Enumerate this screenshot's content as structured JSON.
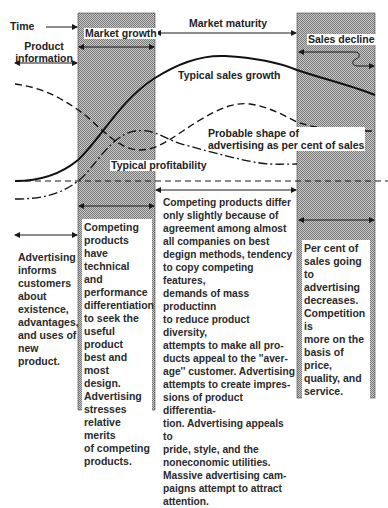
{
  "labels": {
    "time": "Time",
    "product_information": [
      "Product",
      "information"
    ],
    "market_growth": "Market growth",
    "market_maturity": "Market maturity",
    "sales_decline": "Sales decline",
    "typical_sales_growth": "Typical sales growth",
    "probable_shape": [
      "Probable shape of",
      "advertising as per cent of sales"
    ],
    "typical_profitability": "Typical profitability"
  },
  "stages": [
    {
      "name": "Product information",
      "description": [
        "Advertising",
        "informs",
        "customers",
        "about",
        "existence,",
        "advantages,",
        "and uses of",
        "new product."
      ]
    },
    {
      "name": "Market growth",
      "description": [
        "Competing",
        "products have",
        "technical and",
        "performance",
        "differentiation",
        "to seek the",
        "useful product",
        "best and most",
        "design.",
        "Advertising",
        "stresses",
        "relative merits",
        "of competing",
        "products."
      ]
    },
    {
      "name": "Market maturity",
      "description": [
        "Competing products differ",
        "only slightly because of",
        "agreement among almost",
        "all companies on best",
        "degign methods, tendency",
        "to copy competing features,",
        "demands of mass productinn",
        "to reduce product diversity,",
        "attempts to make all pro-",
        "ducts appeal to the ''aver-",
        "age'' customer. Advertising",
        "attempts to create impres-",
        "sions of product differentia-",
        "tion. Advertising appeals to",
        "pride, style, and the",
        "noneconomic utilities.",
        "Massive advertising cam-",
        "paigns attempt to attract",
        "attention."
      ]
    },
    {
      "name": "Sales decline",
      "description": [
        "Per cent of",
        "sales going to",
        "advertising",
        "decreases.",
        "Competition is",
        "more on the",
        "basis of price,",
        "quality, and",
        "service."
      ]
    }
  ],
  "curves": {
    "sales": {
      "name": "Typical sales growth",
      "style": "solid"
    },
    "advertising": {
      "name": "Probable shape of advertising as per cent of sales",
      "style": "long-dash"
    },
    "profitability": {
      "name": "Typical profitability",
      "style": "dash-dot"
    },
    "baseline": {
      "name": "zero line",
      "style": "short-dash"
    }
  },
  "colors": {
    "ink": "#1a1a1a",
    "shade": "#9a9a9a",
    "paper": "#ffffff"
  }
}
